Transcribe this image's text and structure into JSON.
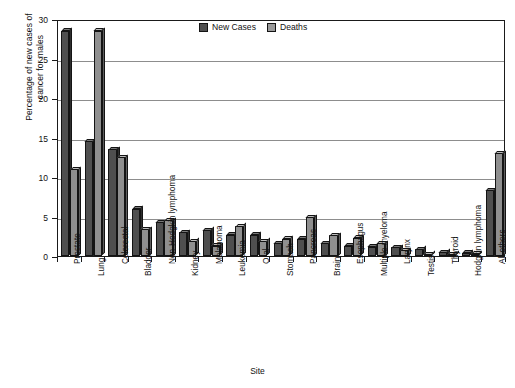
{
  "chart_data": {
    "type": "bar",
    "title": "",
    "xlabel": "Site",
    "ylabel": "Percentage of new cases of\ncancer for males",
    "ylim": [
      0,
      30
    ],
    "yticks": [
      0,
      5,
      10,
      15,
      20,
      25,
      30
    ],
    "grid": true,
    "legend_position": "top-center",
    "categories": [
      "Prostate",
      "Lung",
      "Colorectal",
      "Bladder",
      "Non-Hodgkin lymphoma",
      "Kidney",
      "Melanoma",
      "Leukemia",
      "Oral",
      "Stomach",
      "Pancreas",
      "Brain",
      "Esophagus",
      "Multiple myeloma",
      "Larynx",
      "Testis",
      "Thyroid",
      "Hodgkin lymphoma",
      "All others"
    ],
    "series": [
      {
        "name": "New Cases",
        "color": "#4f4f4f",
        "values": [
          28.5,
          14.5,
          13.5,
          6.0,
          4.3,
          3.0,
          3.3,
          2.7,
          2.7,
          1.6,
          2.2,
          1.6,
          1.3,
          1.2,
          1.1,
          0.9,
          0.5,
          0.4,
          8.3
        ]
      },
      {
        "name": "Deaths",
        "color": "#8f8f8f",
        "values": [
          11.0,
          28.5,
          12.5,
          3.4,
          4.5,
          1.9,
          1.3,
          3.8,
          1.9,
          2.2,
          4.9,
          2.6,
          2.3,
          1.6,
          0.7,
          0.2,
          0.2,
          0.3,
          13.0
        ]
      }
    ]
  },
  "legend": {
    "entries": [
      {
        "label": "New Cases",
        "key": "newcases"
      },
      {
        "label": "Deaths",
        "key": "deaths"
      }
    ]
  },
  "axes": {
    "y_title_line1": "Percentage of new cases of",
    "y_title_line2": "cancer for males",
    "x_title": "Site",
    "y_tick_labels": [
      "0",
      "5",
      "10",
      "15",
      "20",
      "25",
      "30"
    ]
  }
}
